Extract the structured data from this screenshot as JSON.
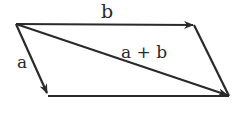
{
  "diagram": {
    "labels": {
      "b": "b",
      "a": "a",
      "sum": "a + b"
    },
    "vertices": {
      "origin": [
        16,
        24
      ],
      "b_tip": [
        194,
        25
      ],
      "a_tip": [
        48,
        95
      ],
      "sum_tip": [
        229,
        96
      ]
    },
    "stroke_color": "#2a2a2a"
  }
}
